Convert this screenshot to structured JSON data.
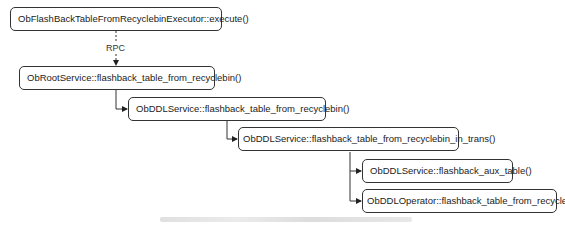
{
  "diagram": {
    "type": "call-hierarchy",
    "nodes": [
      {
        "id": "n1",
        "label": "ObFlashBackTableFromRecyclebinExecutor::execute()"
      },
      {
        "id": "n2",
        "label": "ObRootService::flashback_table_from_recyclebin()"
      },
      {
        "id": "n3",
        "label": "ObDDLService::flashback_table_from_recyclebin()"
      },
      {
        "id": "n4",
        "label": "ObDDLService::flashback_table_from_recyclebin_in_trans()"
      },
      {
        "id": "n5",
        "label": "ObDDLService::flashback_aux_table()"
      },
      {
        "id": "n6",
        "label": "ObDDLOperator::flashback_table_from_recyclebin()"
      }
    ],
    "edges": [
      {
        "from": "n1",
        "to": "n2",
        "label": "RPC",
        "style": "dashed"
      },
      {
        "from": "n2",
        "to": "n3",
        "style": "solid"
      },
      {
        "from": "n3",
        "to": "n4",
        "style": "solid"
      },
      {
        "from": "n4",
        "to": "n5",
        "style": "solid"
      },
      {
        "from": "n4",
        "to": "n6",
        "style": "solid"
      }
    ],
    "caption": ""
  }
}
